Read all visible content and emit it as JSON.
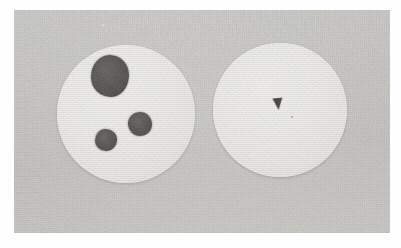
{
  "figure": {
    "kind": "photograph",
    "caption": "",
    "width_px": 401,
    "height_px": 248
  },
  "photo": {
    "frame": {
      "left": 14,
      "top": 10,
      "width": 376,
      "height": 223
    },
    "page_background_color": "#fefefe",
    "background_color": "#c9c8c5",
    "texture": "film-grain-halftone"
  },
  "objects": {
    "left_disc": {
      "label": "left-disc",
      "center_x": 126,
      "center_y": 114,
      "radius": 69,
      "fill_color": "#f2f1ee",
      "spot_count": 3,
      "spots": [
        {
          "label": "large-spot",
          "center_x": 110,
          "center_y": 76,
          "radius_x": 19,
          "radius_y": 21,
          "color": "#5a5a58",
          "size": "large"
        },
        {
          "label": "medium-spot",
          "center_x": 140,
          "center_y": 124,
          "radius_x": 12,
          "radius_y": 12,
          "color": "#5d5c59",
          "size": "medium"
        },
        {
          "label": "small-spot",
          "center_x": 106,
          "center_y": 140,
          "radius_x": 11,
          "radius_y": 11,
          "color": "#5c5b58",
          "size": "small"
        }
      ]
    },
    "right_disc": {
      "label": "right-disc",
      "center_x": 280,
      "center_y": 110,
      "radius": 67,
      "fill_color": "#f3f2ef",
      "spot_count": 0,
      "mark": {
        "label": "triangular-mark",
        "center_x": 278,
        "center_y": 104,
        "width": 11,
        "height": 12,
        "color": "#4e4d4a",
        "shape": "triangle"
      }
    }
  },
  "colors": {
    "background": "#c9c8c5",
    "disc": "#f2f1ee",
    "spot": "#5a5a58",
    "mark": "#4e4d4a",
    "page": "#fefefe"
  }
}
